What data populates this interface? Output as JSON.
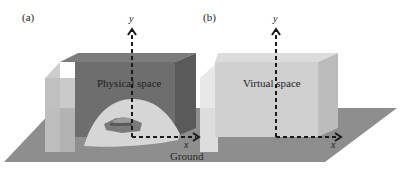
{
  "figure": {
    "panels": [
      {
        "id": "a",
        "label": "(a)",
        "space_label": "Physical space",
        "axes": {
          "x": "x",
          "y": "y"
        },
        "contains_object": "vehicle on mapped dome region"
      },
      {
        "id": "b",
        "label": "(b)",
        "space_label": "Virtual space",
        "axes": {
          "x": "x",
          "y": "y"
        }
      }
    ],
    "ground_label": "Ground",
    "colors": {
      "ground": "#8c8c8c",
      "physical_front": "#6f6f6f",
      "physical_top": "#7a7a7a",
      "physical_side": "#5c5c5c",
      "translucent_panel": "#bdbdbd",
      "dome": "#d9d9d9",
      "virtual_front": "#cfcfcf",
      "virtual_top": "#dadada",
      "virtual_side": "#b8b8b8",
      "axis": "#1a1a1a"
    }
  }
}
